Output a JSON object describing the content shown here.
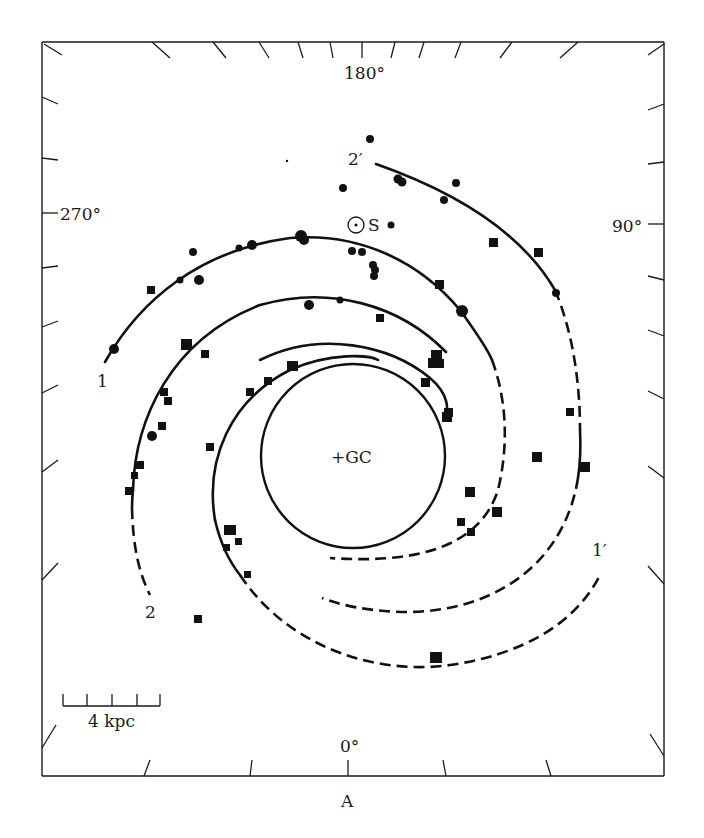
{
  "figure": {
    "panel_label": "A",
    "scale_bar": {
      "label": "4 kpc",
      "ticks": 5
    },
    "longitude_labels": {
      "top": "180°",
      "left": "270°",
      "right": "90°",
      "bottom": "0°"
    },
    "center_label": "+GC",
    "sun_label": "S",
    "arm_labels": {
      "arm1": "1",
      "arm2": "2",
      "arm1_prime": "1′",
      "arm2_prime": "2′"
    },
    "colors": {
      "ink": "#111111",
      "background": "#ffffff"
    },
    "marker_types": [
      "circle (filled)",
      "square (filled)"
    ]
  }
}
